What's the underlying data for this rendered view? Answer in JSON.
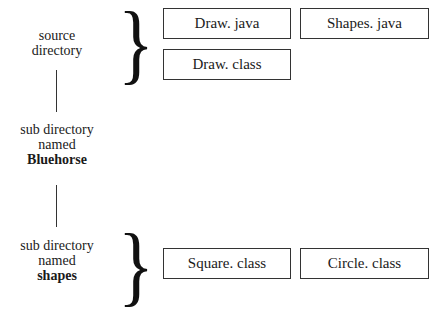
{
  "diagram": {
    "nodes": [
      {
        "id": "source",
        "lines": [
          "source",
          "directory"
        ],
        "bold": ""
      },
      {
        "id": "bluehorse",
        "lines": [
          "sub directory",
          "named"
        ],
        "bold": "Bluehorse"
      },
      {
        "id": "shapes",
        "lines": [
          "sub directory",
          "named"
        ],
        "bold": "shapes"
      }
    ],
    "source_files": [
      "Draw. java",
      "Shapes. java",
      "Draw. class"
    ],
    "shapes_files": [
      "Square. class",
      "Circle. class"
    ],
    "brace_glyph": "}"
  }
}
